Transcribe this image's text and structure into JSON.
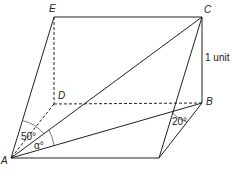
{
  "diagram": {
    "type": "3D geometry prism",
    "points": {
      "A": {
        "label": "A"
      },
      "B": {
        "label": "B"
      },
      "C": {
        "label": "C"
      },
      "D": {
        "label": "D"
      },
      "E": {
        "label": "E"
      }
    },
    "measures": {
      "side_label": "1 unit",
      "angle_at_A_left": "50°",
      "angle_at_A_alpha": "α°",
      "angle_at_B": "20°"
    }
  }
}
